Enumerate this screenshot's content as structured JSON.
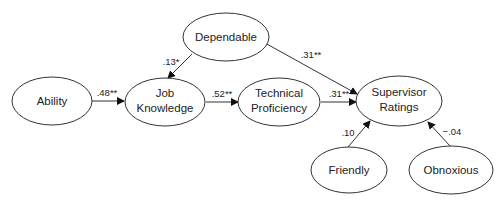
{
  "diagram": {
    "type": "path-diagram",
    "nodes": {
      "dependable": {
        "lines": [
          "Dependable"
        ]
      },
      "ability": {
        "lines": [
          "Ability"
        ]
      },
      "job_knowledge": {
        "lines": [
          "Job",
          "Knowledge"
        ]
      },
      "technical_proficiency": {
        "lines": [
          "Technical",
          "Proficiency"
        ]
      },
      "supervisor_ratings": {
        "lines": [
          "Supervisor",
          "Ratings"
        ]
      },
      "friendly": {
        "lines": [
          "Friendly"
        ]
      },
      "obnoxious": {
        "lines": [
          "Obnoxious"
        ]
      }
    },
    "edges": {
      "ability_to_job_knowledge": {
        "from": "Ability",
        "to": "Job Knowledge",
        "label": ".48**"
      },
      "dependable_to_job_knowledge": {
        "from": "Dependable",
        "to": "Job Knowledge",
        "label": ".13*"
      },
      "job_knowledge_to_technical_proficiency": {
        "from": "Job Knowledge",
        "to": "Technical Proficiency",
        "label": ".52**"
      },
      "technical_proficiency_to_supervisor_ratings": {
        "from": "Technical Proficiency",
        "to": "Supervisor Ratings",
        "label": ".31**"
      },
      "dependable_to_supervisor_ratings": {
        "from": "Dependable",
        "to": "Supervisor Ratings",
        "label": ".31**"
      },
      "friendly_to_supervisor_ratings": {
        "from": "Friendly",
        "to": "Supervisor Ratings",
        "label": ".10"
      },
      "obnoxious_to_supervisor_ratings": {
        "from": "Obnoxious",
        "to": "Supervisor Ratings",
        "label": "−.04"
      }
    },
    "colors": {
      "stroke": "#333333",
      "text": "#222222",
      "background": "#ffffff"
    }
  }
}
